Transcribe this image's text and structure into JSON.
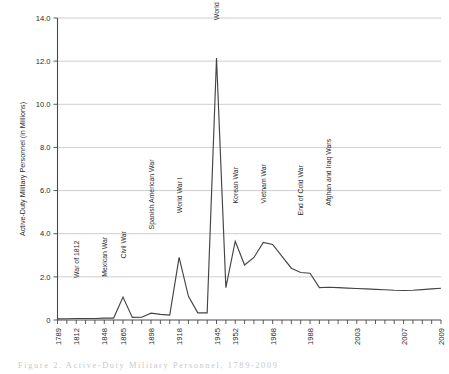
{
  "figure": {
    "caption": "Figure 2.   Active-Duty Military Personnel, 1789-2009"
  },
  "chart_data": {
    "type": "line",
    "title": "",
    "xlabel": "",
    "ylabel": "Active-Duty Military Personnel (in Millions)",
    "ylim": [
      0.0,
      14.0
    ],
    "yticks": [
      "0",
      "2.0",
      "4.0",
      "6.0",
      "8.0",
      "10.0",
      "12.0",
      "14.0"
    ],
    "ytick_values": [
      0.0,
      2.0,
      4.0,
      6.0,
      8.0,
      10.0,
      12.0,
      14.0
    ],
    "xticks": [
      "1789",
      "1812",
      "1848",
      "1865",
      "1898",
      "1918",
      "1945",
      "1952",
      "1968",
      "1988",
      "2003",
      "2007",
      "2009"
    ],
    "xtick_index": [
      0,
      2,
      5,
      7,
      10,
      13,
      17,
      19,
      23,
      27,
      32,
      37,
      41
    ],
    "grid": true,
    "legend": "none",
    "series": [
      {
        "name": "Active-Duty Military Personnel",
        "color": "#444444",
        "x": [
          0,
          1,
          2,
          3,
          4,
          5,
          6,
          7,
          8,
          9,
          10,
          11,
          12,
          13,
          14,
          15,
          16,
          17,
          18,
          19,
          20,
          21,
          22,
          23,
          24,
          25,
          26,
          27,
          28,
          29,
          30,
          31,
          32,
          33,
          34,
          35,
          36,
          37,
          38,
          39,
          40,
          41
        ],
        "values": [
          0.05,
          0.06,
          0.07,
          0.07,
          0.07,
          0.09,
          0.09,
          1.06,
          0.12,
          0.13,
          0.32,
          0.26,
          0.23,
          2.9,
          1.1,
          0.33,
          0.33,
          12.15,
          1.5,
          3.65,
          2.55,
          2.9,
          3.6,
          3.5,
          2.95,
          2.4,
          2.2,
          2.17,
          1.5,
          1.52,
          1.5,
          1.48,
          1.46,
          1.44,
          1.42,
          1.4,
          1.38,
          1.37,
          1.38,
          1.41,
          1.44,
          1.47
        ]
      }
    ],
    "annotations": [
      {
        "label": "War of 1812",
        "x_index": 2,
        "y": 1.95
      },
      {
        "label": "Mexican War",
        "x_index": 5,
        "y": 2.0
      },
      {
        "label": "Civil War",
        "x_index": 7,
        "y": 2.85
      },
      {
        "label": "Spanish American War",
        "x_index": 10,
        "y": 4.2
      },
      {
        "label": "World War I",
        "x_index": 13,
        "y": 4.95
      },
      {
        "label": "World War II",
        "x_index": 17,
        "y": 13.9
      },
      {
        "label": "Korean War",
        "x_index": 19,
        "y": 5.4
      },
      {
        "label": "Vietnam War",
        "x_index": 22,
        "y": 5.4
      },
      {
        "label": "End of Cold War",
        "x_index": 26,
        "y": 4.85
      },
      {
        "label": "Afghan and Iraq Wars",
        "x_index": 29,
        "y": 5.3
      }
    ]
  }
}
